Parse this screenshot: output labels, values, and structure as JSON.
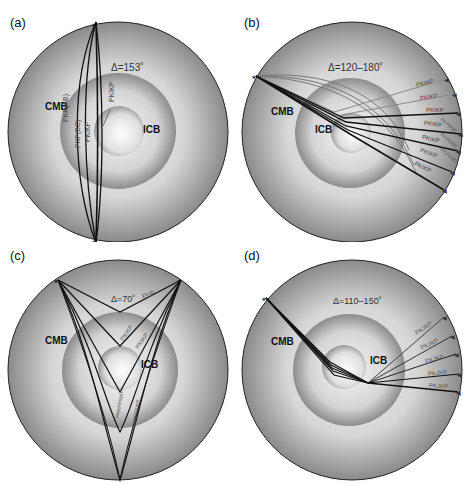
{
  "figure": {
    "type": "seismic ray path diagrams through Earth's core",
    "panels": [
      {
        "id": "a",
        "label": "(a)",
        "distance": "Δ=153˚",
        "layers": {
          "cmb": "CMB",
          "icb": "ICB"
        },
        "phases": [
          "PKP(AB)",
          "PKP(BC)",
          "PKiKP",
          "PKIKP"
        ]
      },
      {
        "id": "b",
        "label": "(b)",
        "distance": "Δ=120–180˚",
        "layers": {
          "cmb": "CMB",
          "icb": "ICB"
        },
        "phases": [
          "PKIKP",
          "PKIKP",
          "PKIKP",
          "PKIKP",
          "PKIKP",
          "PKIKP",
          "PKIKP"
        ],
        "secondary_phases": [
          "PKP(AB)",
          "PKP(AB)",
          "PKP(AB)"
        ]
      },
      {
        "id": "c",
        "label": "(c)",
        "distance": "Δ=70˚",
        "layers": {
          "cmb": "CMB",
          "icb": "ICB"
        },
        "phases": [
          "PcP",
          "PKiKP",
          "PKIKP",
          "PKiKPPKiKP",
          "PKIKPPKIKP"
        ]
      },
      {
        "id": "d",
        "label": "(d)",
        "distance": "Δ=110–150˚",
        "layers": {
          "cmb": "CMB",
          "icb": "ICB"
        },
        "phases": [
          "PKJKP",
          "PKJKP",
          "PKJKP",
          "PKJKP",
          "PKJKP"
        ]
      }
    ],
    "colors": {
      "mantle_edge": "#7a7a7a",
      "mantle_center": "#f4f4f4",
      "ray": "#111111",
      "ray_gray": "#777777",
      "outline": "#222222"
    }
  }
}
